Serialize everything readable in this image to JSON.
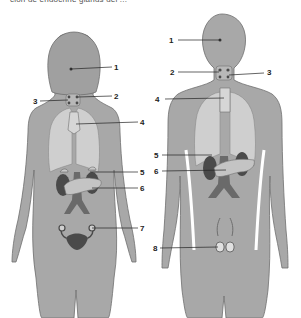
{
  "caption": "ción de endocrine glands del ...",
  "colors": {
    "body": "#a8a8a8",
    "body_outline": "#6e6e6e",
    "lungs": "#cfcfcf",
    "organs_dark": "#4a4a4a",
    "organs_mid": "#8a8a8a",
    "pancreas": "#c4c4c4",
    "leader_line": "#222222"
  },
  "figures": [
    {
      "name": "female",
      "labels": [
        {
          "num": "1"
        },
        {
          "num": "2"
        },
        {
          "num": "3"
        },
        {
          "num": "4"
        },
        {
          "num": "5"
        },
        {
          "num": "6"
        },
        {
          "num": "7"
        }
      ]
    },
    {
      "name": "male",
      "labels": [
        {
          "num": "1"
        },
        {
          "num": "2"
        },
        {
          "num": "3"
        },
        {
          "num": "4"
        },
        {
          "num": "5"
        },
        {
          "num": "6"
        },
        {
          "num": "8"
        }
      ]
    }
  ]
}
